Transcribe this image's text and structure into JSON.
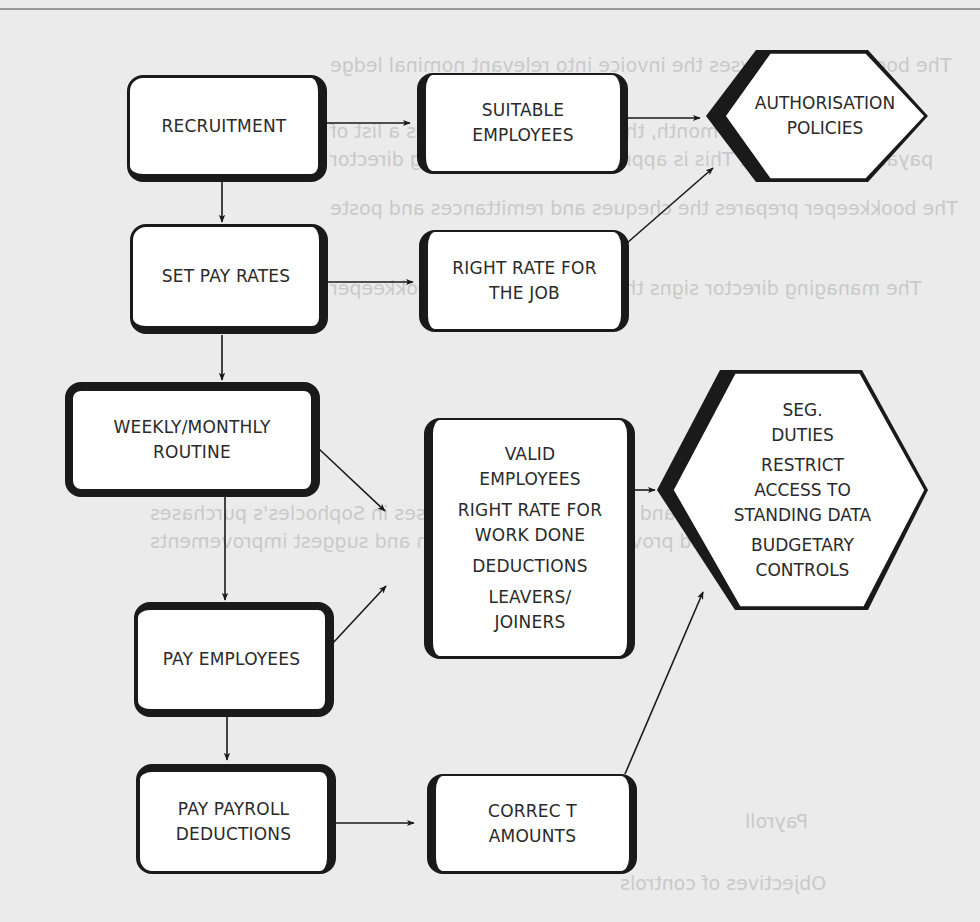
{
  "diagram": {
    "process_steps": [
      {
        "id": "recruitment",
        "lines": [
          "RECRUITMENT"
        ]
      },
      {
        "id": "set-pay-rates",
        "lines": [
          "SET PAY RATES"
        ]
      },
      {
        "id": "weekly-monthly-routine",
        "lines": [
          "WEEKLY/MONTHLY",
          "ROUTINE"
        ]
      },
      {
        "id": "pay-employees",
        "lines": [
          "PAY EMPLOYEES"
        ]
      },
      {
        "id": "pay-payroll-deductions",
        "lines": [
          "PAY PAYROLL",
          "DEDUCTIONS"
        ]
      }
    ],
    "objectives": [
      {
        "id": "suitable-employees",
        "lines": [
          "SUITABLE",
          "EMPLOYEES"
        ]
      },
      {
        "id": "right-rate-job",
        "lines": [
          "RIGHT RATE FOR",
          "THE JOB"
        ]
      },
      {
        "id": "valid-employees",
        "groups": [
          [
            "VALID",
            "EMPLOYEES"
          ],
          [
            "RIGHT RATE FOR",
            "WORK DONE"
          ],
          [
            "DEDUCTIONS"
          ],
          [
            "LEAVERS/",
            "JOINERS"
          ]
        ]
      },
      {
        "id": "correct-amounts",
        "lines": [
          "CORREC T",
          "AMOUNTS"
        ]
      }
    ],
    "controls": [
      {
        "id": "authorisation-policies",
        "lines": [
          "AUTHORISATION",
          "POLICIES"
        ]
      },
      {
        "id": "seg-duties",
        "groups": [
          [
            "SEG.",
            "DUTIES"
          ],
          [
            "RESTRICT",
            "ACCESS TO",
            "STANDING DATA"
          ],
          [
            "BUDGETARY",
            "CONTROLS"
          ]
        ]
      }
    ],
    "edges": [
      [
        "recruitment",
        "suitable-employees"
      ],
      [
        "recruitment",
        "set-pay-rates"
      ],
      [
        "suitable-employees",
        "authorisation-policies"
      ],
      [
        "set-pay-rates",
        "right-rate-job"
      ],
      [
        "set-pay-rates",
        "weekly-monthly-routine"
      ],
      [
        "right-rate-job",
        "authorisation-policies"
      ],
      [
        "weekly-monthly-routine",
        "valid-employees"
      ],
      [
        "weekly-monthly-routine",
        "pay-employees"
      ],
      [
        "pay-employees",
        "valid-employees"
      ],
      [
        "pay-employees",
        "pay-payroll-deductions"
      ],
      [
        "valid-employees",
        "seg-duties"
      ],
      [
        "pay-payroll-deductions",
        "correct-amounts"
      ],
      [
        "correct-amounts",
        "seg-duties"
      ]
    ]
  },
  "show_through_text": {
    "lines": [
      "The bookkeeper analyses the invoice into relevant nominal ledge",
      "accounts and the purchase ledger",
      "At the end of each month, the bookkeeper prepares a list of",
      "payables to be paid. This is approved by the managing director",
      "The bookkeeper prepares the cheques and remittances and poste",
      "the cheques to the purchase ledger and cash book",
      "The managing director signs the cheques and the bookkeeper",
      "sends the cheques and remittances to the payables",
      "For each of the above, identify where there may be weaknesses in",
      "and recommend improvements",
      "Identify and describe the weaknesses in Sophocles's purchases",
      "system and provide a recommendation and suggest improvements",
      "(12 marks)",
      "Payroll",
      "Objectives of controls"
    ]
  },
  "colors": {
    "background": "#ebebeb",
    "box_fill": "#ffffff",
    "stroke": "#1a1a1a",
    "text": "#2a2a2a"
  }
}
